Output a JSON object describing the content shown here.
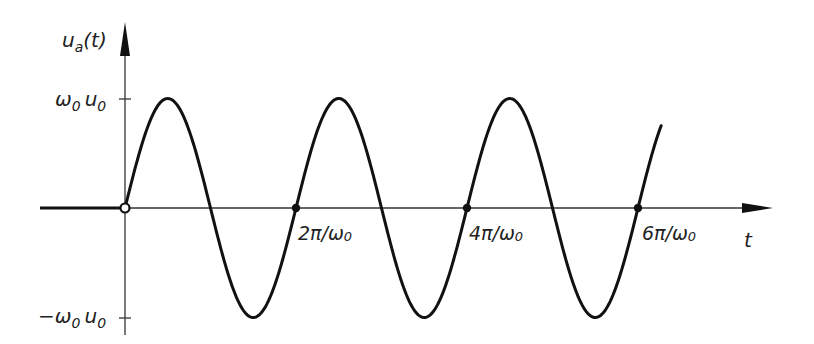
{
  "chart_data": {
    "type": "line",
    "title": "",
    "xlabel": "t",
    "ylabel": "u_a(t)",
    "function": "u_a(t) = 0 for t<0; omega_0*u_0*sin(omega_0*t) for t>=0",
    "y_ticks": [
      {
        "label_main": "ω",
        "label_sub1": "0",
        "label_main2": "u",
        "label_sub2": "0",
        "value": 1
      },
      {
        "label_main": "−ω",
        "label_sub1": "0",
        "label_main2": "u",
        "label_sub2": "0",
        "value": -1
      }
    ],
    "x_marks": [
      {
        "num": "2π/ω",
        "sub": "0",
        "value_rad": 6.2832
      },
      {
        "num": "4π/ω",
        "sub": "0",
        "value_rad": 12.5664
      },
      {
        "num": "6π/ω",
        "sub": "0",
        "value_rad": 18.8496
      }
    ],
    "x_range_rad": [
      -5.0,
      19.7
    ],
    "y_range": [
      -1,
      1
    ],
    "origin_marker": "open-circle",
    "zero_crossing_markers": "filled-dots at 2π/ω0, 4π/ω0, 6π/ω0"
  },
  "labels": {
    "y_axis_main": "u",
    "y_axis_sub": "a",
    "y_axis_arg": "(t)",
    "x_axis": "t"
  }
}
